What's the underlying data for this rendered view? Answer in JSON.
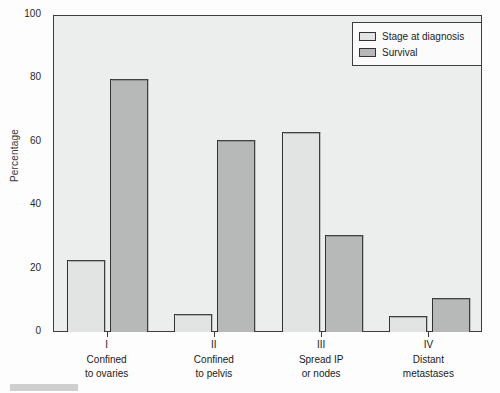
{
  "chart_data": {
    "type": "bar",
    "title": "",
    "xlabel": "",
    "ylabel": "Percentage",
    "ylim": [
      0,
      100
    ],
    "yticks": [
      0,
      20,
      40,
      60,
      80,
      100
    ],
    "grid": false,
    "legend_position": "top-right",
    "categories": [
      "I",
      "II",
      "III",
      "IV"
    ],
    "category_descriptions": [
      [
        "Confined",
        "to ovaries"
      ],
      [
        "Confined",
        "to pelvis"
      ],
      [
        "Spread IP",
        "or nodes"
      ],
      [
        "Distant",
        "metastases"
      ]
    ],
    "series": [
      {
        "name": "Stage at diagnosis",
        "color": "#e2e3e3",
        "values": [
          23,
          6,
          63.5,
          5.5
        ]
      },
      {
        "name": "Survival",
        "color": "#b7b8b8",
        "values": [
          80,
          61,
          31,
          11
        ]
      }
    ]
  },
  "axis": {
    "ylabel": "Percentage",
    "tick_labels": [
      "0",
      "20",
      "40",
      "60",
      "80",
      "100"
    ]
  },
  "legend": {
    "items": [
      {
        "label": "Stage at diagnosis"
      },
      {
        "label": "Survival"
      }
    ]
  },
  "caption": {
    "fragment": ""
  }
}
